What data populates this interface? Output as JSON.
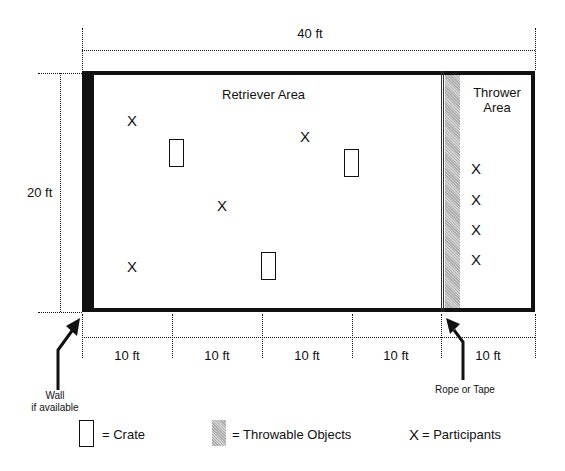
{
  "dimensions": {
    "width_label": "40 ft",
    "height_label": "20 ft",
    "segments": [
      "10 ft",
      "10 ft",
      "10 ft",
      "10 ft",
      "10 ft"
    ]
  },
  "areas": {
    "retriever": "Retriever Area",
    "thrower_line1": "Thrower",
    "thrower_line2": "Area"
  },
  "annotations": {
    "wall_line1": "Wall",
    "wall_line2": "if available",
    "rope": "Rope or Tape"
  },
  "participants": {
    "symbol": "X",
    "retriever_positions": [
      [
        132,
        121
      ],
      [
        305,
        136
      ],
      [
        222,
        206
      ],
      [
        132,
        267
      ]
    ],
    "thrower_positions": [
      [
        476,
        169
      ],
      [
        476,
        200
      ],
      [
        476,
        230
      ],
      [
        476,
        260
      ]
    ]
  },
  "crates": [
    [
      169,
      139,
      15,
      28
    ],
    [
      344,
      149,
      15,
      28
    ],
    [
      261,
      252,
      15,
      28
    ]
  ],
  "legend": {
    "crate": "= Crate",
    "throwable": "= Throwable Objects",
    "participant_symbol": "X",
    "participant": "= Participants"
  }
}
